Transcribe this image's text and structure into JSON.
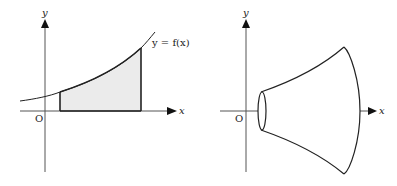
{
  "left_figure": {
    "y_axis_label": "y",
    "x_axis_label": "x",
    "origin_label": "O",
    "curve_label": "y = f(x)",
    "shaded_region": "area under curve between two vertical lines",
    "fill_color": "#ebebeb",
    "stroke_color": "#222222"
  },
  "right_figure": {
    "y_axis_label": "y",
    "x_axis_label": "x",
    "origin_label": "O",
    "solid": "solid of revolution about the x-axis",
    "stroke_color": "#222222"
  }
}
